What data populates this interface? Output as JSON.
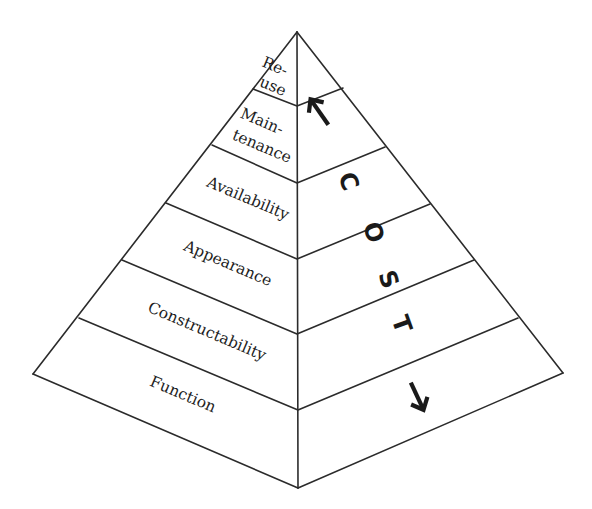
{
  "diagram": {
    "type": "pyramid",
    "title": "",
    "layers_bottom_to_top": [
      {
        "id": "function",
        "label": "Function"
      },
      {
        "id": "constructability",
        "label": "Constructability"
      },
      {
        "id": "appearance",
        "label": "Appearance"
      },
      {
        "id": "availability",
        "label": "Availability"
      },
      {
        "id": "maintenance",
        "label": "Maintenance",
        "lines": [
          "Main-",
          "tenance"
        ]
      },
      {
        "id": "reuse",
        "label": "Re-use",
        "lines": [
          "Re-",
          "use"
        ]
      }
    ],
    "side_label": {
      "letters": [
        "C",
        "O",
        "S",
        "T"
      ],
      "text": "COST",
      "arrows": [
        "up-arrow",
        "down-arrow"
      ]
    },
    "colors": {
      "line": "#2b2b2b",
      "text": "#1e1e1e",
      "background": "#ffffff"
    }
  }
}
